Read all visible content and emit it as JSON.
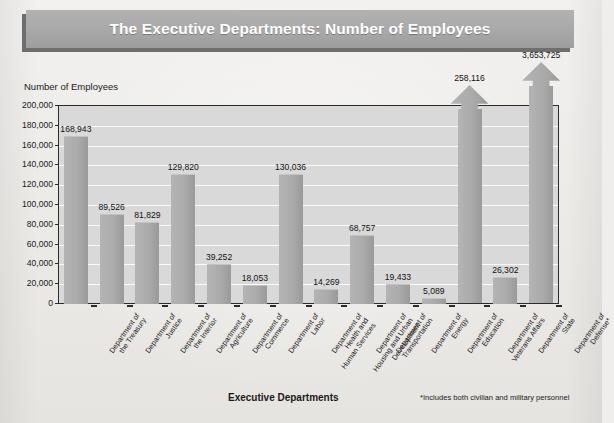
{
  "title": "The Executive Departments: Number of Employees",
  "colors": {
    "banner": "#a9a9a9",
    "banner_shadow": "#6e6e6e",
    "bar": "#ababab",
    "plot_bg": "#d9d9d9",
    "gridline": "#fbfbfb",
    "axis": "#2b2b2b",
    "page_bg": "#efeeec"
  },
  "footnote": "*Includes both civilian and military personnel",
  "chart_data": {
    "type": "bar",
    "title": "The Executive Departments: Number of Employees",
    "xlabel": "Executive Departments",
    "ylabel": "Number of Employees",
    "ylim": [
      0,
      200000
    ],
    "ytick_values": [
      0,
      20000,
      40000,
      60000,
      80000,
      100000,
      120000,
      140000,
      160000,
      180000,
      200000
    ],
    "ytick_labels": [
      "0",
      "20,000",
      "40,000",
      "60,000",
      "80,000",
      "100,000",
      "120,000",
      "140,000",
      "160,000",
      "180,000",
      "200,000"
    ],
    "grid": true,
    "legend": "none",
    "categories": [
      "Department of the Treasury",
      "Department of Justice",
      "Department of the Interior",
      "Department of Agriculture",
      "Department of Commerce",
      "Department of Labor",
      "Department of Health and Human Services",
      "Department of Housing and Urban Development",
      "Department of Transportation",
      "Department of Energy",
      "Department of Education",
      "Department of Veterans Affairs",
      "Department of State",
      "Department of Defense*"
    ],
    "category_lines": [
      [
        "Department of",
        "the Treasury"
      ],
      [
        "Department of",
        "Justice"
      ],
      [
        "Department of",
        "the Interior"
      ],
      [
        "Department of",
        "Agriculture"
      ],
      [
        "Department of",
        "Commerce"
      ],
      [
        "Department of",
        "Labor"
      ],
      [
        "Department of",
        "Health and",
        "Human Services"
      ],
      [
        "Department of",
        "Housing and Urban",
        "Development"
      ],
      [
        "Department of",
        "Transportation"
      ],
      [
        "Department of",
        "Energy"
      ],
      [
        "Department of",
        "Education"
      ],
      [
        "Department of",
        "Veterans Affairs"
      ],
      [
        "Department of",
        "State"
      ],
      [
        "Department of",
        "Defense*"
      ]
    ],
    "values": [
      168943,
      89526,
      81829,
      129820,
      39252,
      18053,
      130036,
      14269,
      68757,
      19433,
      5089,
      258116,
      26302,
      3653725
    ],
    "value_labels": [
      "168,943",
      "89,526",
      "81,829",
      "129,820",
      "39,252",
      "18,053",
      "130,036",
      "14,269",
      "68,757",
      "19,433",
      "5,089",
      "258,116",
      "26,302",
      "3,653,725"
    ],
    "truncated_bars": [
      false,
      false,
      false,
      false,
      false,
      false,
      false,
      false,
      false,
      false,
      false,
      true,
      false,
      true
    ],
    "note": "Bars for Department of Veterans Affairs and Department of Defense exceed the 200,000 axis maximum and are drawn as upward arrows breaking the top of the plot."
  }
}
